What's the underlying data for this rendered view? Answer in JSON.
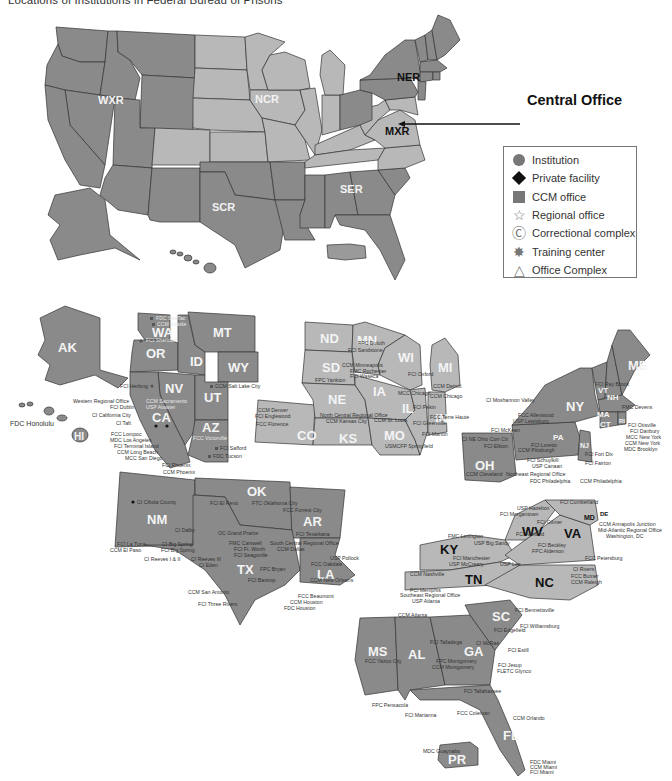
{
  "title": "Locations of Institutions in Federal Bureau of Prisons",
  "central_office": {
    "label": "Central Office",
    "arrow": "←"
  },
  "regions": [
    {
      "code": "WXR",
      "name": "Western Region"
    },
    {
      "code": "NCR",
      "name": "North Central Region"
    },
    {
      "code": "SCR",
      "name": "South Central Region"
    },
    {
      "code": "SER",
      "name": "Southeast Region"
    },
    {
      "code": "NER",
      "name": "Northeast Region"
    },
    {
      "code": "MXR",
      "name": "Mid-Atlantic Region"
    }
  ],
  "region_labels": {
    "wxr": "WXR",
    "ncr": "NCR",
    "scr": "SCR",
    "ser": "SER",
    "ner": "NER",
    "mxr": "MXR"
  },
  "legend": {
    "items": [
      {
        "icon": "circle",
        "label": "Institution",
        "color": "#777777"
      },
      {
        "icon": "diamond",
        "label": "Private facility",
        "color": "#111111"
      },
      {
        "icon": "square",
        "label": "CCM office",
        "color": "#777777"
      },
      {
        "icon": "star",
        "label": "Regional office",
        "glyph": "☆"
      },
      {
        "icon": "circled-c",
        "label": "Correctional complex",
        "glyph": "Ⓒ"
      },
      {
        "icon": "starburst",
        "label": "Training center",
        "glyph": "✸"
      },
      {
        "icon": "triangle",
        "label": "Office Complex",
        "glyph": "△"
      }
    ]
  },
  "state_labels": {
    "ak": "AK",
    "hi": "HI",
    "wa": "WA",
    "or": "OR",
    "id": "ID",
    "mt": "MT",
    "wy": "WY",
    "nv": "NV",
    "ut": "UT",
    "ca": "CA",
    "az": "AZ",
    "nd": "ND",
    "mn": "MN",
    "sd": "SD",
    "wi": "WI",
    "mi": "MI",
    "ne": "NE",
    "ia": "IA",
    "il": "IL",
    "in": "IN",
    "co": "CO",
    "ks": "KS",
    "mo": "MO",
    "me": "ME",
    "vt": "VT",
    "nh": "NH",
    "ny": "NY",
    "ma": "MA",
    "ct": "CT",
    "ri": "RI",
    "pa": "PA",
    "nj": "NJ",
    "oh": "OH",
    "ok": "OK",
    "nm": "NM",
    "ar": "AR",
    "tx": "TX",
    "la": "LA",
    "wv": "WV",
    "md": "MD",
    "de": "DE",
    "va": "VA",
    "ky": "KY",
    "tn": "TN",
    "nc": "NC",
    "sc": "SC",
    "ms": "MS",
    "al": "AL",
    "ga": "GA",
    "fl": "FL",
    "pr": "PR"
  },
  "facilities": {
    "west": [
      "FDC SeaTac",
      "CCM Seattle",
      "FCI Sheridan",
      "FCI Herlong",
      "CCM Salt Lake City",
      "Western Regional Office",
      "FCI Dublin",
      "CCM Sacramento",
      "USP Atwater",
      "CI California City",
      "CI Taft",
      "FCC Lompoc",
      "MDC Los Angeles",
      "FCI Terminal Island",
      "CCM Long Beach",
      "MCC San Diego",
      "FCC Victorville",
      "FCI Safford",
      "FDC Tucson",
      "FCI Phoenix",
      "CCM Phoenix",
      "FDC Honolulu"
    ],
    "north_central": [
      "CCM Denver",
      "FCI Englewood",
      "FCC Florence",
      "FPC Duluth",
      "FCI Sandstone",
      "CCM Minneapolis",
      "FMC Rochester",
      "FCI Waseca",
      "FPC Yankton",
      "FCI Oxford",
      "Federal Correctional Academy",
      "USP Leavenworth",
      "North Central Regional Office",
      "CCM Kansas City",
      "MCC Chicago",
      "CCM Detroit",
      "FCI Milan",
      "CCM Chicago",
      "FCI Pekin",
      "FCC Terre Haute",
      "CCM St. Louis",
      "FCI Greenville",
      "FCI Marion",
      "USMCFP Springfield"
    ],
    "northeast": [
      "CI Moshannon Valley",
      "FCI Ray Brook",
      "FMC Devens",
      "FCI Otisville",
      "FCI Danbury",
      "MCC New York",
      "CCM New York",
      "MDC Brooklyn",
      "FCC Allenwood",
      "USP Lewisburg",
      "FCI McKean",
      "FCI Fort Dix",
      "FCI Elkton",
      "CI NE Ohio Corr Ctr",
      "FCI Loretto",
      "CCM Pittsburgh",
      "FCI Schuylkill",
      "USP Canaan",
      "FCI Fairton",
      "Northeast Regional Office",
      "FDC Philadelphia",
      "CCM Philadelphia",
      "CCM Cleveland"
    ],
    "south_central": [
      "CI Cibola County",
      "FCI El Reno",
      "FTC Oklahoma City",
      "FCC Forrest City",
      "CI Dalby",
      "OC Grand Prairie",
      "FCI Texarkana",
      "FCI La Tuna",
      "CI Big Spring",
      "CCM El Paso",
      "FCI Big Spring",
      "FMC Carswell",
      "South Central Regional Office",
      "FCI Ft. Worth",
      "CCM Dallas",
      "FCI Seagoville",
      "CI Reeves I & II",
      "CI Reeves III",
      "CI Eden",
      "FPC Bryan",
      "USP Pollock",
      "FCC Oakdale",
      "FCI Bastrop",
      "CCM New Orleans",
      "CCM San Antonio",
      "FCC Beaumont",
      "CCM Houston",
      "FDC Houston",
      "FCI Three Rivers"
    ],
    "mid_atlantic": [
      "FCI Cumberland",
      "USP Hazelton",
      "FCI Morgantown",
      "FCI Gilmer",
      "FMC Lexington",
      "FCI Ashland",
      "CCM Annapolis Junction",
      "Mid-Atlantic Regional Office",
      "Washington, DC",
      "USP Big Sandy",
      "FCI Beckley",
      "FPC Alderson",
      "FCI Manchester",
      "USP McCreary",
      "USP Lee",
      "FCC Petersburg",
      "CCM Nashville",
      "CI Rivers",
      "FCC Butner",
      "CCM Raleigh",
      "FCI Memphis"
    ],
    "southeast": [
      "Southeast Regional Office",
      "USP Atlanta",
      "CCM Atlanta",
      "FCI Bennettsville",
      "FCI Williamsburg",
      "FCI Edgefield",
      "FCI Talladega",
      "CI McRae",
      "FCI Estill",
      "FPC Montgomery",
      "CCM Montgomery",
      "FCC Yazoo City",
      "FCI Jesup",
      "FLETC Glynco",
      "FCI Tallahassee",
      "FPC Pensacola",
      "FCI Marianna",
      "FCC Coleman",
      "CCM Orlando",
      "MDC Guaynabo",
      "FDC Miami",
      "CCM Miami",
      "FCI Miami"
    ]
  }
}
